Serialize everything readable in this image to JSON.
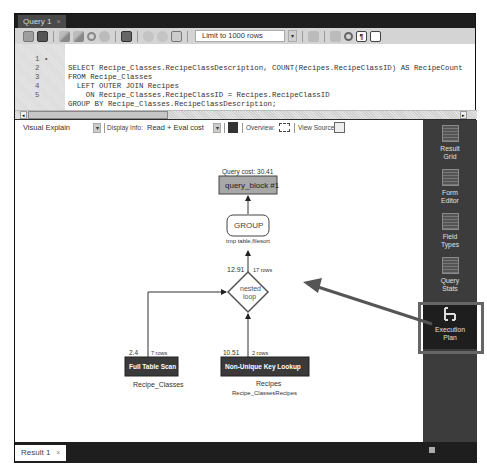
{
  "window": {
    "tab_label": "Query 1",
    "tab_close": "×"
  },
  "toolbar": {
    "icons": [
      "open-file-icon",
      "save-icon",
      "execute-icon",
      "execute-current-icon",
      "explain-icon",
      "stop-icon",
      "toggle-continue-icon",
      "commit-icon",
      "rollback-icon",
      "autocommit-icon",
      "beautify-icon",
      "find-icon",
      "invisible-chars-icon",
      "wrap-icon"
    ],
    "limit_select": "Limit to 1000 rows",
    "limit_arrow": "▾",
    "invisible_glyph": "¶"
  },
  "editor": {
    "lines": [
      {
        "num": "1",
        "marker": "•",
        "text": "SELECT Recipe_Classes.RecipeClassDescription, COUNT(Recipes.RecipeClassID) AS RecipeCount"
      },
      {
        "num": "2",
        "marker": "",
        "text": "FROM Recipe_Classes"
      },
      {
        "num": "3",
        "marker": "",
        "text": "  LEFT OUTER JOIN Recipes"
      },
      {
        "num": "4",
        "marker": "",
        "text": "    ON Recipe_Classes.RecipeClassID = Recipes.RecipeClassID"
      },
      {
        "num": "5",
        "marker": "",
        "text": "GROUP BY Recipe_Classes.RecipeClassDescription;"
      }
    ]
  },
  "scrollbar": {
    "left": "◂",
    "right": "▸"
  },
  "explain_bar": {
    "view": "Visual Explain",
    "view_arrow": "▾",
    "display_info_label": "Display Info:",
    "display_info_value": "Read + Eval cost",
    "display_info_arrow": "▾",
    "overview_label": "Overview:",
    "view_source_label": "View Source:"
  },
  "diagram": {
    "query_cost_label": "Query cost: 30.41",
    "query_block": "query_block #1",
    "group": "GROUP",
    "group_sub": "tmp table,filesort",
    "nested_cost": "12.91",
    "nested_rows": "17 rows",
    "nested_label_1": "nested",
    "nested_label_2": "loop",
    "fts_cost": "2.4",
    "fts_rows": "7 rows",
    "fts_label": "Full Table Scan",
    "fts_table": "Recipe_Classes",
    "nukl_cost": "10.51",
    "nukl_rows": "2 rows",
    "nukl_label": "Non-Unique Key Lookup",
    "nukl_table": "Recipes",
    "nukl_key": "Recipe_ClassesRecipes"
  },
  "sidebar": {
    "items": [
      {
        "line1": "Result",
        "line2": "Grid"
      },
      {
        "line1": "Form",
        "line2": "Editor"
      },
      {
        "line1": "Field",
        "line2": "Types"
      },
      {
        "line1": "Query",
        "line2": "Stats"
      },
      {
        "line1": "Execution",
        "line2": "Plan"
      }
    ]
  },
  "bottom": {
    "result_tab": "Result 1",
    "result_close": "×"
  },
  "colors": {
    "frame": "#2b2b2b",
    "node_dark": "#3a3a3a",
    "query_block_fill": "#a8a8a8",
    "annotation_arrow": "#555555"
  }
}
